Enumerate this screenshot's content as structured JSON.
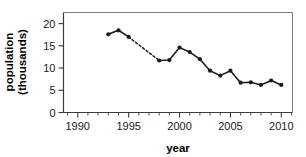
{
  "chart_data": {
    "type": "line",
    "title": "",
    "xlabel": "year",
    "ylabel": "population (thousands)",
    "ylabel_line1": "population",
    "ylabel_line2": "(thousands)",
    "xlim": [
      1988.6,
      2011.1
    ],
    "ylim": [
      0,
      22.5
    ],
    "xticks": [
      1990,
      1995,
      2000,
      2005,
      2010
    ],
    "xtick_labels": [
      "1990",
      "1995",
      "2000",
      "2005",
      "2010"
    ],
    "xticks_minor": [
      1989,
      1991,
      1992,
      1993,
      1994,
      1996,
      1997,
      1998,
      1999,
      2001,
      2002,
      2003,
      2004,
      2006,
      2007,
      2008,
      2009,
      2011
    ],
    "yticks": [
      0,
      5,
      10,
      15,
      20
    ],
    "ytick_labels": [
      "0",
      "5",
      "10",
      "15",
      "20"
    ],
    "grid": false,
    "legend": false,
    "line_color": "#1c1c1c",
    "marker": "circle",
    "x": [
      1993,
      1994,
      1995,
      1998,
      1999,
      2000,
      2001,
      2002,
      2003,
      2004,
      2005,
      2006,
      2007,
      2008,
      2009,
      2010
    ],
    "values": [
      17.6,
      18.5,
      17.0,
      11.7,
      11.8,
      14.6,
      13.6,
      12.0,
      9.4,
      8.3,
      9.4,
      6.7,
      6.8,
      6.2,
      7.2,
      6.2
    ],
    "segments": [
      {
        "style": "solid",
        "x": [
          1993,
          1994,
          1995
        ],
        "values": [
          17.6,
          18.5,
          17.0
        ]
      },
      {
        "style": "dashed",
        "x": [
          1995,
          1998
        ],
        "values": [
          17.0,
          11.7
        ]
      },
      {
        "style": "solid",
        "x": [
          1998,
          1999,
          2000,
          2001,
          2002,
          2003,
          2004,
          2005,
          2006,
          2007,
          2008,
          2009,
          2010
        ],
        "values": [
          11.7,
          11.8,
          14.6,
          13.6,
          12.0,
          9.4,
          8.3,
          9.4,
          6.7,
          6.8,
          6.2,
          7.2,
          6.2
        ]
      }
    ]
  }
}
